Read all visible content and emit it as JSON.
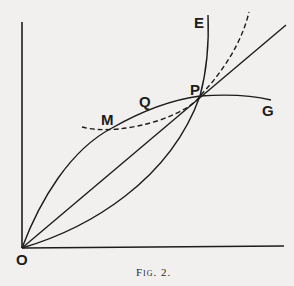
{
  "figure": {
    "caption": "Fig. 2.",
    "labels": {
      "origin": "O",
      "E": "E",
      "P": "P",
      "Q": "Q",
      "M": "M",
      "G": "G"
    },
    "colors": {
      "background": "#f1f0ee",
      "ink": "#1c1c1c"
    }
  }
}
